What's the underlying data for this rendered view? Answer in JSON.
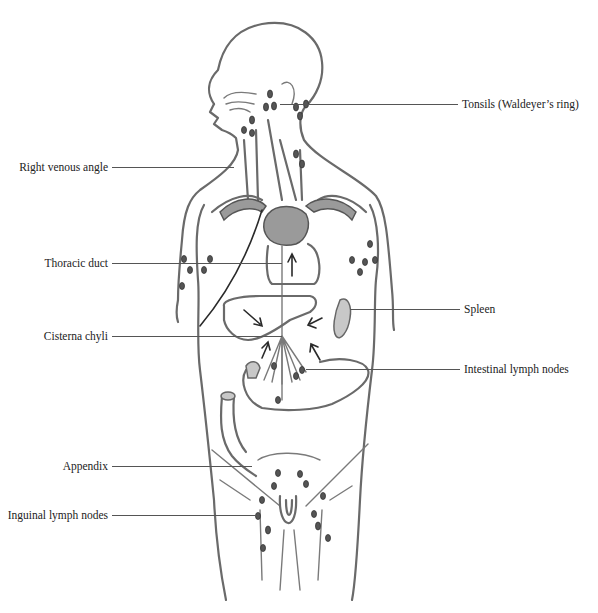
{
  "figure": {
    "labels": {
      "left": [
        {
          "text": "Right venous angle",
          "y": 167
        },
        {
          "text": "Thoracic duct",
          "y": 263
        },
        {
          "text": "Cisterna chyli",
          "y": 336
        },
        {
          "text": "Appendix",
          "y": 466
        },
        {
          "text": "Inguinal lymph nodes",
          "y": 515
        }
      ],
      "right": [
        {
          "text": "Tonsils (Waldeyer’s ring)",
          "y": 104
        },
        {
          "text": "Spleen",
          "y": 309
        },
        {
          "text": "Intestinal lymph nodes",
          "y": 369
        }
      ]
    }
  }
}
